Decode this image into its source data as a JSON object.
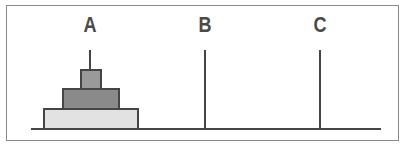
{
  "diagram": {
    "pegs": [
      {
        "label": "A",
        "disks": [
          "small",
          "medium",
          "large"
        ]
      },
      {
        "label": "B",
        "disks": []
      },
      {
        "label": "C",
        "disks": []
      }
    ],
    "colors": {
      "line": "#454545",
      "disk_small": "#9a9a9a",
      "disk_medium": "#8a8a8a",
      "disk_large": "#e2e2e2",
      "frame": "#8a8a8a",
      "label": "#4a4a4a"
    }
  }
}
